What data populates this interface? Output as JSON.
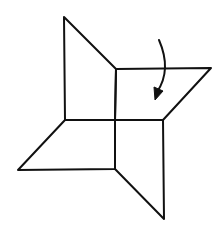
{
  "diagram": {
    "type": "origami-fold-step",
    "colors": {
      "background": "#ffffff",
      "stroke": "#111111"
    },
    "stroke_width": 2,
    "vertices": {
      "center": [
        115,
        120
      ],
      "top_tip": [
        64,
        17
      ],
      "top_inner": [
        116,
        69
      ],
      "right_tip": [
        211,
        68
      ],
      "right_inner": [
        163,
        120
      ],
      "bottom_tip": [
        164,
        219
      ],
      "bottom_inner": [
        115,
        169
      ],
      "left_tip": [
        18,
        170
      ],
      "left_inner": [
        65,
        120
      ]
    },
    "flaps": [
      {
        "name": "top-flap",
        "points": [
          [
            64,
            17
          ],
          [
            116,
            69
          ],
          [
            115,
            120
          ],
          [
            65,
            120
          ]
        ]
      },
      {
        "name": "right-flap",
        "points": [
          [
            116,
            69
          ],
          [
            211,
            68
          ],
          [
            163,
            120
          ],
          [
            115,
            120
          ]
        ]
      },
      {
        "name": "bottom-flap",
        "points": [
          [
            115,
            120
          ],
          [
            163,
            120
          ],
          [
            164,
            219
          ],
          [
            115,
            169
          ]
        ]
      },
      {
        "name": "left-flap",
        "points": [
          [
            65,
            120
          ],
          [
            115,
            120
          ],
          [
            115,
            169
          ],
          [
            18,
            170
          ]
        ]
      }
    ],
    "fold_arrow": {
      "start": [
        159,
        40
      ],
      "control": [
        172,
        70
      ],
      "end": [
        155,
        100
      ],
      "direction": "down",
      "meaning": "fold flap down"
    }
  }
}
